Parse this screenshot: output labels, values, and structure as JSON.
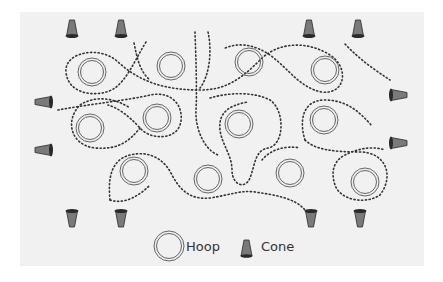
{
  "diagram": {
    "background_color": "#f1f1f1",
    "path_color": "#333333",
    "cone_fill": "#7a7a7a",
    "cone_outline": "#2a2a2a",
    "hoop_stroke": "#666666"
  },
  "hoops": [
    {
      "x": 92,
      "y": 72
    },
    {
      "x": 171,
      "y": 66
    },
    {
      "x": 249,
      "y": 62
    },
    {
      "x": 325,
      "y": 70
    },
    {
      "x": 90,
      "y": 128
    },
    {
      "x": 157,
      "y": 118
    },
    {
      "x": 239,
      "y": 124
    },
    {
      "x": 324,
      "y": 120
    },
    {
      "x": 134,
      "y": 171
    },
    {
      "x": 208,
      "y": 179
    },
    {
      "x": 290,
      "y": 173
    },
    {
      "x": 365,
      "y": 182
    }
  ],
  "cones": [
    {
      "x": 72,
      "y": 29,
      "dir": "up"
    },
    {
      "x": 121,
      "y": 29,
      "dir": "up"
    },
    {
      "x": 309,
      "y": 29,
      "dir": "up"
    },
    {
      "x": 358,
      "y": 29,
      "dir": "up"
    },
    {
      "x": 44,
      "y": 102,
      "dir": "left"
    },
    {
      "x": 44,
      "y": 150,
      "dir": "left"
    },
    {
      "x": 398,
      "y": 95,
      "dir": "right"
    },
    {
      "x": 398,
      "y": 143,
      "dir": "right"
    },
    {
      "x": 72,
      "y": 218,
      "dir": "down"
    },
    {
      "x": 121,
      "y": 218,
      "dir": "down"
    },
    {
      "x": 311,
      "y": 218,
      "dir": "down"
    },
    {
      "x": 360,
      "y": 218,
      "dir": "down"
    }
  ],
  "legend": {
    "hoop_label": "Hoop",
    "cone_label": "Cone"
  }
}
